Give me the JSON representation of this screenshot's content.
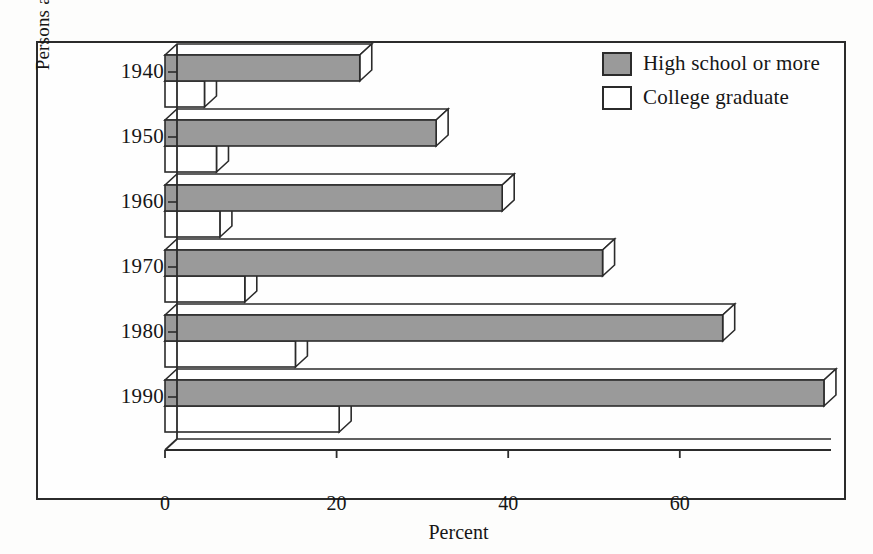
{
  "chart_data": {
    "type": "bar",
    "orientation": "horizontal",
    "style": "3d-grouped-horizontal-bar",
    "title": "",
    "xlabel": "Percent",
    "ylabel": "Persons aged 25 or older",
    "categories": [
      "1940",
      "1950",
      "1960",
      "1970",
      "1980",
      "1990"
    ],
    "series": [
      {
        "name": "High school or more",
        "color": "#9a9a9a",
        "values": [
          22.7,
          31.6,
          39.3,
          51.0,
          65.0,
          76.8
        ]
      },
      {
        "name": "College graduate",
        "color": "#ffffff",
        "values": [
          4.6,
          6.0,
          6.4,
          9.3,
          15.2,
          20.3
        ]
      }
    ],
    "xticks": [
      0,
      20,
      40,
      60
    ],
    "xlim": [
      0,
      80
    ],
    "grid": false,
    "legend_position": "top-right"
  },
  "axes": {
    "x_title": "Percent",
    "y_title": "Persons aged 25 or older",
    "x_tick_labels": [
      "0",
      "20",
      "40",
      "60"
    ],
    "y_tick_labels": [
      "1940",
      "1950",
      "1960",
      "1970",
      "1980",
      "1990"
    ]
  },
  "legend": {
    "items": [
      {
        "label": "High school or more",
        "swatch": "filled"
      },
      {
        "label": "College graduate",
        "swatch": "hollow"
      }
    ]
  },
  "colors": {
    "bar_fill_gray": "#9a9a9a",
    "bar_fill_white": "#ffffff",
    "outline": "#2b2b2b",
    "text": "#161616",
    "background": "#fdfdfc"
  }
}
